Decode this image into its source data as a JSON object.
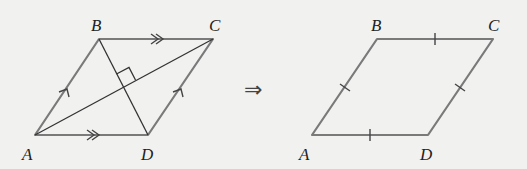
{
  "diagram": {
    "left_figure": {
      "labels": {
        "A": "A",
        "B": "B",
        "C": "C",
        "D": "D"
      },
      "vertices": {
        "A": [
          35,
          135
        ],
        "B": [
          99,
          39
        ],
        "C": [
          213,
          39
        ],
        "D": [
          148,
          135
        ]
      },
      "markings": {
        "AB_CD": "single parallel arrow",
        "BC_AD": "double parallel arrow",
        "diagonals": "perpendicular (right angle mark)"
      }
    },
    "implies": "⇒",
    "right_figure": {
      "labels": {
        "A": "A",
        "B": "B",
        "C": "C",
        "D": "D"
      },
      "vertices": {
        "A": [
          312,
          135
        ],
        "B": [
          377,
          39
        ],
        "C": [
          493,
          39
        ],
        "D": [
          428,
          135
        ]
      },
      "markings": {
        "all_sides": "single tick (equal length)"
      }
    },
    "colors": {
      "background": "#f1f1f0",
      "sides": "#7a7a7a",
      "diagonals": "#333333",
      "labels": "#222222"
    }
  }
}
